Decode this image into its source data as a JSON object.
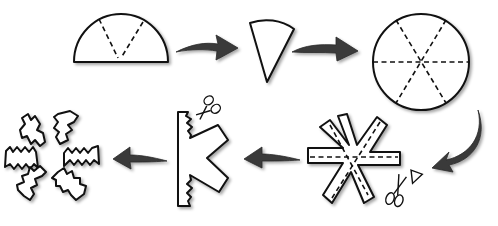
{
  "steps": [
    {
      "name": "semicircle-with-fold-lines",
      "description": "Half circle with two dashed fold lines forming a V"
    },
    {
      "name": "folded-wedge",
      "description": "Folded paper wedge"
    },
    {
      "name": "circle-with-six-fold-lines",
      "description": "Unfolded circle with three dashed diameters"
    },
    {
      "name": "asterisk-cut-shape",
      "description": "Six-armed star cut with scissors"
    },
    {
      "name": "k-shape-jagged-cut",
      "description": "Folded arm piece with jagged edges cut by scissors"
    },
    {
      "name": "jagged-snowflake",
      "description": "Finished six-armed snowflake with zigzag edges"
    }
  ],
  "colors": {
    "outline": "#111111",
    "arrow": "#3a3a3a",
    "background": "#ffffff"
  }
}
